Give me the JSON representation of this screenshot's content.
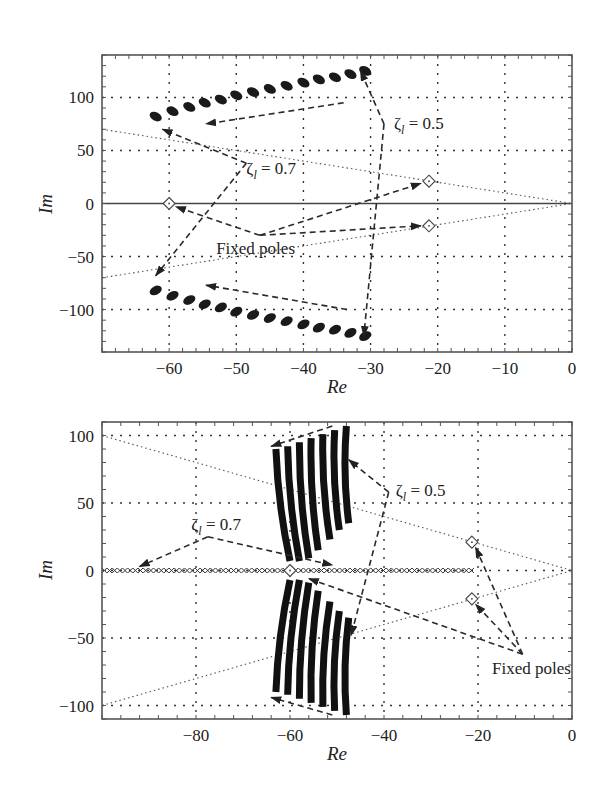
{
  "chart_data": [
    {
      "type": "scatter",
      "title": "",
      "xlabel": "Re",
      "ylabel": "Im",
      "xlim": [
        -70,
        0
      ],
      "ylim": [
        -140,
        140
      ],
      "grid": true,
      "xticks": [
        -60,
        -50,
        -40,
        -30,
        -20,
        -10,
        0
      ],
      "xtick_labels": [
        "−60",
        "−50",
        "−40",
        "−30",
        "−20",
        "−10",
        "0"
      ],
      "yticks": [
        100,
        50,
        0,
        -50,
        -100
      ],
      "ytick_labels": [
        "100",
        "50",
        "0",
        "−50",
        "−100"
      ],
      "series": [
        {
          "name": "Closed-loop poles (upper branch)",
          "marker": "cluster",
          "x": [
            -62,
            -59.5,
            -57,
            -54.7,
            -52.3,
            -50,
            -47.5,
            -45,
            -42.5,
            -40,
            -37.7,
            -35.3,
            -33,
            -30.8
          ],
          "y": [
            82,
            87,
            91,
            95,
            98,
            102,
            105,
            108,
            111,
            114,
            117,
            119,
            122,
            125
          ]
        },
        {
          "name": "Closed-loop poles (lower branch)",
          "marker": "cluster",
          "x": [
            -62,
            -59.5,
            -57,
            -54.7,
            -52.3,
            -50,
            -47.5,
            -45,
            -42.5,
            -40,
            -37.7,
            -35.3,
            -33,
            -30.8
          ],
          "y": [
            -82,
            -87,
            -91,
            -95,
            -98,
            -102,
            -105,
            -108,
            -111,
            -114,
            -117,
            -119,
            -122,
            -125
          ]
        },
        {
          "name": "Fixed poles",
          "marker": "diamond",
          "x": [
            -60,
            -21.3,
            -21.3
          ],
          "y": [
            0,
            21,
            -21
          ]
        }
      ],
      "damping_lines": [
        {
          "from": [
            -70,
            70
          ],
          "to": [
            0,
            0
          ]
        },
        {
          "from": [
            -70,
            -70
          ],
          "to": [
            0,
            0
          ]
        }
      ],
      "annotations": [
        {
          "text": "ζ",
          "sub": "l",
          "rest": " = 0.5",
          "x": -26.5,
          "y": 70,
          "arrows": [
            {
              "path": [
                [
                  -28,
                  75
                ],
                [
                  -31.5,
                  125
                ]
              ]
            },
            {
              "path": [
                [
                  -28,
                  75
                ],
                [
                  -31,
                  -125
                ]
              ]
            }
          ]
        },
        {
          "text": "ζ",
          "sub": "l",
          "rest": " = 0.7",
          "x": -48.5,
          "y": 28,
          "arrows": [
            {
              "path": [
                [
                  -48.5,
                  38
                ],
                [
                  -61,
                  70
                ]
              ]
            },
            {
              "path": [
                [
                  -48.5,
                  38
                ],
                [
                  -62,
                  -68
                ]
              ]
            }
          ]
        },
        {
          "text": "Fixed poles",
          "sub": "",
          "rest": "",
          "x": -53,
          "y": -48,
          "arrows": [
            {
              "path": [
                [
                  -34,
                  95
                ],
                [
                  -54.5,
                  75
                ]
              ]
            },
            {
              "path": [
                [
                  -33.5,
                  -100
                ],
                [
                  -54.5,
                  -77
                ]
              ]
            },
            {
              "path": [
                [
                  -46.5,
                  -30
                ],
                [
                  -59,
                  -3
                ]
              ]
            },
            {
              "path": [
                [
                  -46.5,
                  -30
                ],
                [
                  -22.5,
                  19
                ]
              ]
            },
            {
              "path": [
                [
                  -46.5,
                  -30
                ],
                [
                  -22.5,
                  -21
                ]
              ]
            }
          ]
        }
      ]
    },
    {
      "type": "scatter",
      "title": "",
      "xlabel": "Re",
      "ylabel": "Im",
      "xlim": [
        -100,
        0
      ],
      "ylim": [
        -110,
        110
      ],
      "grid": true,
      "xticks": [
        -80,
        -60,
        -40,
        -20,
        0
      ],
      "xtick_labels": [
        "−80",
        "−60",
        "−40",
        "−20",
        "0"
      ],
      "yticks": [
        100,
        50,
        0,
        -50,
        -100
      ],
      "ytick_labels": [
        "100",
        "50",
        "0",
        "−50",
        "−100"
      ],
      "series": [
        {
          "name": "Closed-loop pole arcs (upper)",
          "marker": "dense-x-arc",
          "arcs": [
            {
              "x_top": -63,
              "y_top": 90,
              "x_bottom": -60,
              "y_bottom": 7
            },
            {
              "x_top": -60.5,
              "y_top": 92,
              "x_bottom": -58,
              "y_bottom": 7
            },
            {
              "x_top": -58,
              "y_top": 95,
              "x_bottom": -56,
              "y_bottom": 9
            },
            {
              "x_top": -55.5,
              "y_top": 98,
              "x_bottom": -54,
              "y_bottom": 15
            },
            {
              "x_top": -53,
              "y_top": 101,
              "x_bottom": -51.5,
              "y_bottom": 23
            },
            {
              "x_top": -50.5,
              "y_top": 104,
              "x_bottom": -49.5,
              "y_bottom": 30
            },
            {
              "x_top": -48,
              "y_top": 107,
              "x_bottom": -47.5,
              "y_bottom": 35
            }
          ]
        },
        {
          "name": "Closed-loop pole arcs (lower)",
          "marker": "dense-x-arc",
          "mirror_of": "upper"
        },
        {
          "name": "Real-axis poles",
          "marker": "x",
          "x_range": [
            -100,
            -21
          ],
          "y": 0
        },
        {
          "name": "Fixed poles",
          "marker": "diamond",
          "x": [
            -60,
            -21.3,
            -21.3
          ],
          "y": [
            0,
            21,
            -21
          ]
        }
      ],
      "damping_lines": [
        {
          "from": [
            -100,
            100
          ],
          "to": [
            0,
            0
          ]
        },
        {
          "from": [
            -100,
            -100
          ],
          "to": [
            0,
            0
          ]
        }
      ],
      "annotations": [
        {
          "text": "ζ",
          "sub": "l",
          "rest": " = 0.5",
          "x": -37.5,
          "y": 55,
          "arrows": [
            {
              "path": [
                [
                  -39,
                  58
                ],
                [
                  -47.5,
                  82
                ]
              ]
            },
            {
              "path": [
                [
                  -39,
                  58
                ],
                [
                  -47,
                  -48
                ]
              ]
            }
          ]
        },
        {
          "text": "ζ",
          "sub": "l",
          "rest": " = 0.7",
          "x": -81,
          "y": 30,
          "arrows": [
            {
              "path": [
                [
                  -77.5,
                  25
                ],
                [
                  -92,
                  3
                ]
              ]
            },
            {
              "path": [
                [
                  -77.5,
                  25
                ],
                [
                  -51,
                  4
                ]
              ]
            }
          ]
        },
        {
          "text": "Fixed poles",
          "sub": "",
          "rest": "",
          "x": -17,
          "y": -77,
          "arrows": [
            {
              "path": [
                [
                  -10.5,
                  -62
                ],
                [
                  -20.5,
                  17
                ]
              ]
            },
            {
              "path": [
                [
                  -10.5,
                  -62
                ],
                [
                  -20.5,
                  -25
                ]
              ]
            },
            {
              "path": [
                [
                  -10.5,
                  -62
                ],
                [
                  -56,
                  -6
                ]
              ]
            },
            {
              "path": [
                [
                  -51,
                  107
                ],
                [
                  -64,
                  92
                ]
              ]
            },
            {
              "path": [
                [
                  -51,
                  -107
                ],
                [
                  -64,
                  -94
                ]
              ]
            }
          ]
        }
      ]
    }
  ],
  "plots": [
    {
      "frame": {
        "left": 102,
        "top": 55,
        "right": 572,
        "bottom": 352
      },
      "xlabel": "Re",
      "ylabel": "Im"
    },
    {
      "frame": {
        "left": 102,
        "top": 422,
        "right": 572,
        "bottom": 719
      },
      "xlabel": "Re",
      "ylabel": "Im"
    }
  ]
}
